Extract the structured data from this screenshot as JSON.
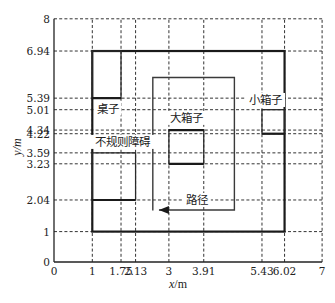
{
  "figure": {
    "type": "layout-diagram",
    "x_axis": {
      "title_var": "x",
      "title_unit": "/m",
      "range": [
        0,
        7
      ],
      "ticks": [
        {
          "value": 0,
          "label": "0"
        },
        {
          "value": 1,
          "label": "1"
        },
        {
          "value": 1.75,
          "label": "1.75"
        },
        {
          "value": 2.13,
          "label": "2.13"
        },
        {
          "value": 3,
          "label": "3"
        },
        {
          "value": 3.91,
          "label": "3.91"
        },
        {
          "value": 5.43,
          "label": "5.43"
        },
        {
          "value": 6.02,
          "label": "6.02"
        },
        {
          "value": 7,
          "label": "7"
        }
      ]
    },
    "y_axis": {
      "title": "y/m",
      "range": [
        0,
        8
      ],
      "ticks": [
        {
          "value": 0,
          "label": "0"
        },
        {
          "value": 1,
          "label": "1"
        },
        {
          "value": 2.04,
          "label": "2.04"
        },
        {
          "value": 3.23,
          "label": "3.23"
        },
        {
          "value": 3.59,
          "label": "3.59"
        },
        {
          "value": 4.22,
          "label": "4.22"
        },
        {
          "value": 4.34,
          "label": "4.34"
        },
        {
          "value": 5.01,
          "label": "5.01"
        },
        {
          "value": 5.39,
          "label": "5.39"
        },
        {
          "value": 6.94,
          "label": "6.94"
        },
        {
          "value": 8,
          "label": "8"
        }
      ]
    },
    "grid": {
      "dashed": true,
      "x_lines": [
        1,
        1.75,
        2.13,
        3,
        3.91,
        5.43,
        6.02,
        7
      ],
      "y_lines": [
        1,
        2.04,
        3.23,
        3.59,
        4.22,
        4.34,
        5.01,
        5.39,
        6.94,
        8
      ]
    },
    "boundary": {
      "name": "room-boundary",
      "x": [
        1,
        6.02
      ],
      "y": [
        1,
        6.94
      ]
    },
    "obstacles": [
      {
        "name": "desk",
        "label": "桌子",
        "x": [
          1,
          1.75
        ],
        "y": [
          5.39,
          6.94
        ],
        "thick_edges": [
          "bottom"
        ],
        "label_pos": [
          1.41,
          5.05
        ]
      },
      {
        "name": "irregular-obstacle",
        "label": "不规则障碍",
        "x": [
          1,
          2.13
        ],
        "y": [
          2.04,
          3.59
        ],
        "thick_edges": [
          "bottom"
        ],
        "label_pos": [
          1.8,
          3.95
        ]
      },
      {
        "name": "large-box",
        "label": "大箱子",
        "x": [
          3,
          3.91
        ],
        "y": [
          3.23,
          4.34
        ],
        "thick_edges": [
          "top",
          "bottom"
        ],
        "label_pos": [
          3.47,
          4.74
        ]
      },
      {
        "name": "small-box",
        "label": "小箱子",
        "x": [
          5.43,
          6.02
        ],
        "y": [
          4.22,
          5.01
        ],
        "thick_edges": [
          "bottom"
        ],
        "label_pos": [
          5.52,
          5.33
        ]
      }
    ],
    "path": {
      "label": "路径",
      "label_pos": [
        3.73,
        2.04
      ],
      "points": [
        [
          2.58,
          1.69
        ],
        [
          2.58,
          6.07
        ],
        [
          4.71,
          6.07
        ],
        [
          4.71,
          1.71
        ],
        [
          2.74,
          1.71
        ]
      ],
      "arrow_direction": "left"
    }
  }
}
